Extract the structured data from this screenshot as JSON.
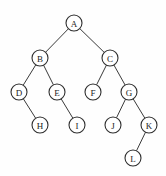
{
  "figure": {
    "background_color": "#fefefe",
    "node_fill_color": "#ffffff",
    "node_stroke_color": "#2e2e2e",
    "edge_color": "#3a3a3a",
    "label_color": "#1c1c1c",
    "node_radius": 8
  },
  "chart_data": {
    "type": "diagram",
    "diagram_type": "binary-tree",
    "node_count": 12,
    "edge_count": 11,
    "root": "A",
    "nodes": [
      {
        "id": "A",
        "label": "A",
        "x": 74,
        "y": 23,
        "depth": 0
      },
      {
        "id": "B",
        "label": "B",
        "x": 40,
        "y": 58,
        "depth": 1
      },
      {
        "id": "C",
        "label": "C",
        "x": 110,
        "y": 58,
        "depth": 1
      },
      {
        "id": "D",
        "label": "D",
        "x": 19,
        "y": 92,
        "depth": 2
      },
      {
        "id": "E",
        "label": "E",
        "x": 57,
        "y": 92,
        "depth": 2
      },
      {
        "id": "F",
        "label": "F",
        "x": 93,
        "y": 92,
        "depth": 2
      },
      {
        "id": "G",
        "label": "G",
        "x": 129,
        "y": 92,
        "depth": 2
      },
      {
        "id": "H",
        "label": "H",
        "x": 40,
        "y": 125,
        "depth": 3
      },
      {
        "id": "I",
        "label": "I",
        "x": 77,
        "y": 125,
        "depth": 3
      },
      {
        "id": "J",
        "label": "J",
        "x": 113,
        "y": 125,
        "depth": 3
      },
      {
        "id": "K",
        "label": "K",
        "x": 149,
        "y": 125,
        "depth": 3
      },
      {
        "id": "L",
        "label": "L",
        "x": 133,
        "y": 158,
        "depth": 4
      }
    ],
    "edges": [
      {
        "from": "A",
        "to": "B",
        "side": "left"
      },
      {
        "from": "A",
        "to": "C",
        "side": "right"
      },
      {
        "from": "B",
        "to": "D",
        "side": "left"
      },
      {
        "from": "B",
        "to": "E",
        "side": "right"
      },
      {
        "from": "C",
        "to": "F",
        "side": "left"
      },
      {
        "from": "C",
        "to": "G",
        "side": "right"
      },
      {
        "from": "D",
        "to": "H",
        "side": "right"
      },
      {
        "from": "E",
        "to": "I",
        "side": "right"
      },
      {
        "from": "G",
        "to": "J",
        "side": "left"
      },
      {
        "from": "G",
        "to": "K",
        "side": "right"
      },
      {
        "from": "K",
        "to": "L",
        "side": "left"
      }
    ]
  }
}
